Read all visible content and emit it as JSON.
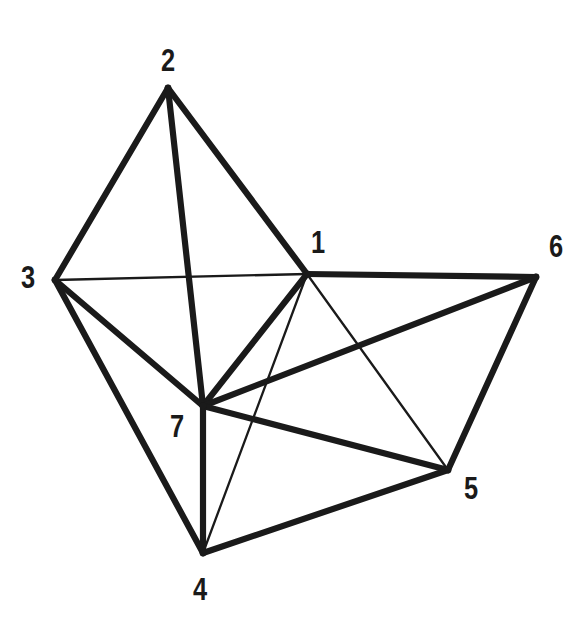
{
  "figure": {
    "kind": "undirected-graph-diagram",
    "width": 571,
    "height": 624,
    "background_color": "#ffffff",
    "ink_color": "#1a1a1a"
  },
  "graph": {
    "vertex_count": 7,
    "edge_count": 15,
    "vertices": [
      {
        "id": "1",
        "label": "1",
        "x": 307,
        "y": 274,
        "label_x": 318,
        "label_y": 242
      },
      {
        "id": "2",
        "label": "2",
        "x": 168,
        "y": 88,
        "label_x": 168,
        "label_y": 60
      },
      {
        "id": "3",
        "label": "3",
        "x": 55,
        "y": 280,
        "label_x": 28,
        "label_y": 277
      },
      {
        "id": "4",
        "label": "4",
        "x": 203,
        "y": 553,
        "label_x": 200,
        "label_y": 589
      },
      {
        "id": "5",
        "label": "5",
        "x": 448,
        "y": 470,
        "label_x": 471,
        "label_y": 488
      },
      {
        "id": "6",
        "label": "6",
        "x": 536,
        "y": 277,
        "label_x": 556,
        "label_y": 246
      },
      {
        "id": "7",
        "label": "7",
        "x": 203,
        "y": 406,
        "label_x": 177,
        "label_y": 426
      }
    ],
    "edges": [
      {
        "from": "2",
        "to": "3",
        "weight": "thick"
      },
      {
        "from": "2",
        "to": "1",
        "weight": "thick"
      },
      {
        "from": "2",
        "to": "7",
        "weight": "thick"
      },
      {
        "from": "3",
        "to": "1",
        "weight": "thin"
      },
      {
        "from": "3",
        "to": "7",
        "weight": "thick"
      },
      {
        "from": "3",
        "to": "4",
        "weight": "thick"
      },
      {
        "from": "1",
        "to": "6",
        "weight": "thick"
      },
      {
        "from": "1",
        "to": "7",
        "weight": "thick"
      },
      {
        "from": "1",
        "to": "5",
        "weight": "thin"
      },
      {
        "from": "1",
        "to": "4",
        "weight": "thin"
      },
      {
        "from": "7",
        "to": "6",
        "weight": "thick"
      },
      {
        "from": "7",
        "to": "5",
        "weight": "thick"
      },
      {
        "from": "7",
        "to": "4",
        "weight": "thick"
      },
      {
        "from": "4",
        "to": "5",
        "weight": "thick"
      },
      {
        "from": "5",
        "to": "6",
        "weight": "thick"
      }
    ],
    "adjacency": {
      "1": [
        "2",
        "3",
        "4",
        "5",
        "6",
        "7"
      ],
      "2": [
        "1",
        "3",
        "7"
      ],
      "3": [
        "1",
        "2",
        "4",
        "7"
      ],
      "4": [
        "1",
        "3",
        "5",
        "7"
      ],
      "5": [
        "1",
        "4",
        "6",
        "7"
      ],
      "6": [
        "1",
        "5",
        "7"
      ],
      "7": [
        "1",
        "2",
        "3",
        "4",
        "5",
        "6"
      ]
    }
  }
}
